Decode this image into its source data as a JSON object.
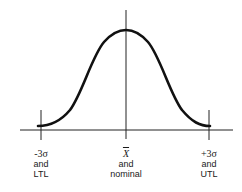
{
  "diagram": {
    "type": "normal-distribution-curve",
    "stroke_color": "#111111",
    "axis_color": "#222222",
    "labels": [
      {
        "id": "left",
        "symbol": "-3σ",
        "line2": "and",
        "line3": "LTL"
      },
      {
        "id": "center",
        "symbol": "X",
        "line2": "and",
        "line3": "nominal"
      },
      {
        "id": "right",
        "symbol": "+3σ",
        "line2": "and",
        "line3": "UTL"
      }
    ]
  }
}
